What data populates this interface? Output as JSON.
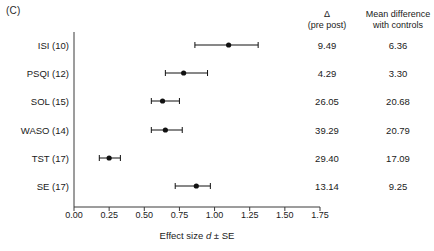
{
  "panel": {
    "label": "(C)"
  },
  "chart_data": {
    "type": "scatter",
    "title": "",
    "xlabel": "Effect size d ± SE",
    "ylabel": "",
    "xlim": [
      0.0,
      1.75
    ],
    "xticks": [
      "0.00",
      "0.25",
      "0.50",
      "0.75",
      "1.00",
      "1.25",
      "1.50",
      "1.75"
    ],
    "xtick_values": [
      0.0,
      0.25,
      0.5,
      0.75,
      1.0,
      1.25,
      1.5,
      1.75
    ],
    "grid": false,
    "legend": "none",
    "marker": "filled-circle-with-error-bars",
    "categories": [
      "ISI (10)",
      "PSQI (12)",
      "SOL (15)",
      "WASO (14)",
      "TST (17)",
      "SE (17)"
    ],
    "values": [
      1.1,
      0.78,
      0.63,
      0.65,
      0.25,
      0.87
    ],
    "error_low": [
      0.86,
      0.65,
      0.55,
      0.55,
      0.18,
      0.72
    ],
    "error_high": [
      1.31,
      0.95,
      0.75,
      0.77,
      0.33,
      0.97
    ],
    "series": [
      {
        "name": "Effect size d ± SE",
        "points": [
          {
            "label": "ISI (10)",
            "d": 1.1,
            "ci_low": 0.86,
            "ci_high": 1.31,
            "delta_pre_post": "9.49",
            "mean_difference_with_controls": "6.36"
          },
          {
            "label": "PSQI (12)",
            "d": 0.78,
            "ci_low": 0.65,
            "ci_high": 0.95,
            "delta_pre_post": "4.29",
            "mean_difference_with_controls": "3.30"
          },
          {
            "label": "SOL (15)",
            "d": 0.63,
            "ci_low": 0.55,
            "ci_high": 0.75,
            "delta_pre_post": "26.05",
            "mean_difference_with_controls": "20.68"
          },
          {
            "label": "WASO (14)",
            "d": 0.65,
            "ci_low": 0.55,
            "ci_high": 0.77,
            "delta_pre_post": "39.29",
            "mean_difference_with_controls": "20.79"
          },
          {
            "label": "TST (17)",
            "d": 0.25,
            "ci_low": 0.18,
            "ci_high": 0.33,
            "delta_pre_post": "29.40",
            "mean_difference_with_controls": "17.09"
          },
          {
            "label": "SE (17)",
            "d": 0.87,
            "ci_low": 0.72,
            "ci_high": 0.97,
            "delta_pre_post": "13.14",
            "mean_difference_with_controls": "9.25"
          }
        ]
      }
    ]
  },
  "columns": {
    "delta_header_line1": "Δ",
    "delta_header_line2": "(pre post)",
    "mean_header_line1": "Mean difference",
    "mean_header_line2": "with controls"
  },
  "axis": {
    "title_prefix": "Effect size ",
    "title_italic": "d",
    "title_suffix": " ± SE"
  },
  "style": {
    "axis_color": "#3a3a3a",
    "marker_color": "#111111",
    "text_color": "#1a1a1a"
  }
}
